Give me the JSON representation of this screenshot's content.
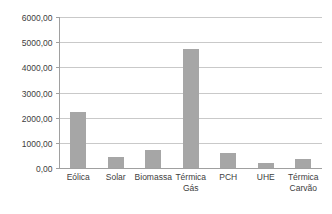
{
  "chart_data": {
    "type": "bar",
    "title": "",
    "subtitle": "",
    "xlabel": "",
    "ylabel": "",
    "categories": [
      "Eólica",
      "Solar",
      "Biomassa",
      "Térmica Gás",
      "PCH",
      "UHE",
      "Térmica Carvão"
    ],
    "category_lines": [
      [
        "Eólica"
      ],
      [
        "Solar"
      ],
      [
        "Biomassa"
      ],
      [
        "Térmica",
        "Gás"
      ],
      [
        "PCH"
      ],
      [
        "UHE"
      ],
      [
        "Térmica",
        "Carvão"
      ]
    ],
    "values": [
      2245,
      437,
      735,
      4728,
      596,
      180,
      375
    ],
    "ylim": [
      0,
      6000
    ],
    "ytick_values": [
      0,
      1000,
      2000,
      3000,
      4000,
      5000,
      6000
    ],
    "ytick_labels": [
      "0,00",
      "1000,00",
      "2000,00",
      "3000,00",
      "4000,00",
      "5000,00",
      "6000,00"
    ],
    "grid": true,
    "grid_axis": "y",
    "legend": false,
    "legend_position": "none",
    "bar_color": "#a6a6a6",
    "gridline_color": "#c9c9c9",
    "axis_color": "#a0a0a0",
    "text_color": "#404040",
    "background_color": "#ffffff"
  }
}
